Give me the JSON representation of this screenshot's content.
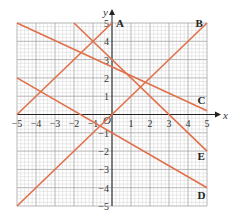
{
  "chart_data": {
    "type": "line",
    "title": "",
    "xlabel": "x",
    "ylabel": "y",
    "origin_label": "O",
    "xlim": [
      -5,
      5
    ],
    "ylim": [
      -5,
      5
    ],
    "grid": true,
    "x_ticks": [
      -5,
      -4,
      -3,
      -2,
      -1,
      1,
      2,
      3,
      4,
      5
    ],
    "y_ticks": [
      -5,
      -4,
      -3,
      -2,
      -1,
      1,
      2,
      3,
      4,
      5
    ],
    "series": [
      {
        "name": "A",
        "equation": "y = x + 5",
        "points": [
          [
            -5,
            0
          ],
          [
            0,
            5
          ]
        ]
      },
      {
        "name": "B",
        "equation": "y = x",
        "points": [
          [
            -5,
            -5
          ],
          [
            5,
            5
          ]
        ]
      },
      {
        "name": "C",
        "equation": "y = -0.48x + 2.6",
        "points": [
          [
            -5,
            5
          ],
          [
            5,
            0.2
          ]
        ]
      },
      {
        "name": "D",
        "equation": "y = -0.6x - 1",
        "points": [
          [
            -5,
            2
          ],
          [
            5,
            -4
          ]
        ]
      },
      {
        "name": "E",
        "equation": "y = -x + 3",
        "points": [
          [
            -2,
            5
          ],
          [
            5,
            -2
          ]
        ]
      }
    ],
    "line_color": "#e0704a"
  }
}
